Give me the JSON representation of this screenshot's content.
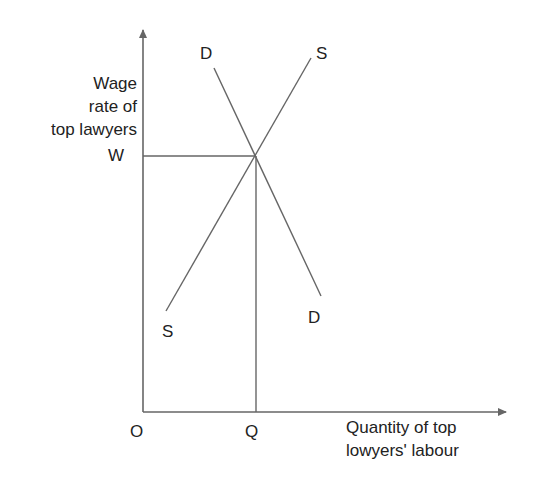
{
  "diagram": {
    "title": "",
    "y_axis_label": [
      "Wage",
      "rate of",
      "top lawyers"
    ],
    "x_axis_label": [
      "Quantity of top",
      "lowyers' labour"
    ],
    "origin_label": "O",
    "equilibrium_wage_label": "W",
    "equilibrium_quantity_label": "Q",
    "demand_curve": {
      "label_top": "D",
      "label_bottom": "D"
    },
    "supply_curve": {
      "label_top": "S",
      "label_bottom": "S"
    },
    "line_color": "#666666",
    "text_color": "#222222"
  }
}
